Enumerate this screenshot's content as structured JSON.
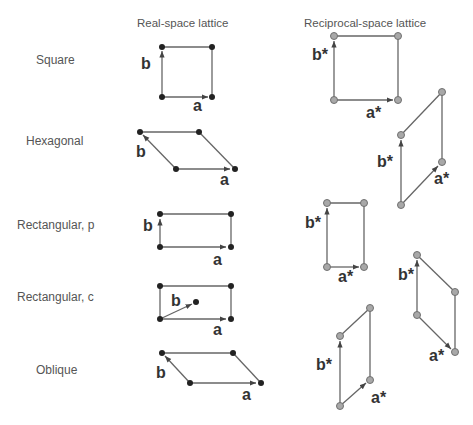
{
  "headers": {
    "real": "Real-space lattice",
    "reciprocal": "Reciprocal-space lattice"
  },
  "rows": [
    {
      "name": "Square"
    },
    {
      "name": "Hexagonal"
    },
    {
      "name": "Rectangular, p"
    },
    {
      "name": "Rectangular, c"
    },
    {
      "name": "Oblique"
    }
  ],
  "vector_labels": {
    "a": "a",
    "b": "b",
    "a_star": "a*",
    "b_star": "b*"
  },
  "colors": {
    "line": "#666666",
    "real_node": "#222222",
    "recip_node_fill": "#a8a8a8",
    "recip_node_stroke": "#707070",
    "label_text": "#555555"
  }
}
